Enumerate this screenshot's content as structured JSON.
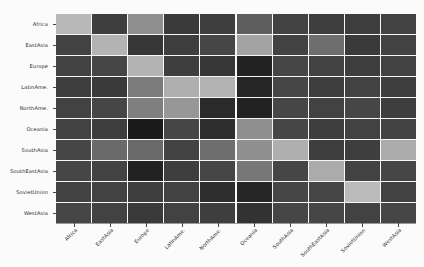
{
  "figure": {
    "background_color": "#fbfbfb",
    "plot_background_color": "#f2f2f2",
    "gridline_color": "#f7f7f7",
    "axis_color": "#9a9a9a",
    "tick_color": "#444444",
    "label_color": "#2a2a2a",
    "colormap": "grayscale",
    "xtick_rotation": "-45"
  },
  "chart_data": {
    "type": "heatmap",
    "title": "",
    "xlabel": "",
    "ylabel": "",
    "grid": true,
    "legend": "none",
    "colorbar": false,
    "vmin": 0,
    "vmax": 100,
    "categories": [
      "Africa",
      "EastAsia",
      "Europe",
      "LatinAme.",
      "NorthAme.",
      "Oceania",
      "SouthAsia",
      "SouthEastAsia",
      "SovietUnion",
      "WestAsia"
    ],
    "x": [
      "Africa",
      "EastAsia",
      "Europe",
      "LatinAme.",
      "NorthAme.",
      "Oceania",
      "SouthAsia",
      "SouthEastAsia",
      "SovietUnion",
      "WestAsia"
    ],
    "y": [
      "Africa",
      "EastAsia",
      "Europe",
      "LatinAme.",
      "NorthAme.",
      "Oceania",
      "SouthAsia",
      "SouthEastAsia",
      "SovietUnion",
      "WestAsia"
    ],
    "rows": [
      {
        "label": "Africa",
        "values": [
          82,
          22,
          62,
          20,
          22,
          38,
          24,
          22,
          22,
          24
        ]
      },
      {
        "label": "EastAsia",
        "values": [
          24,
          80,
          18,
          22,
          26,
          72,
          24,
          46,
          20,
          24
        ]
      },
      {
        "label": "Europe",
        "values": [
          24,
          26,
          80,
          22,
          18,
          8,
          26,
          24,
          22,
          24
        ]
      },
      {
        "label": "LatinAme.",
        "values": [
          22,
          20,
          52,
          78,
          80,
          10,
          26,
          22,
          24,
          22
        ]
      },
      {
        "label": "NorthAme.",
        "values": [
          24,
          26,
          54,
          66,
          12,
          8,
          26,
          24,
          26,
          22
        ]
      },
      {
        "label": "Oceania",
        "values": [
          24,
          22,
          4,
          26,
          14,
          62,
          26,
          22,
          24,
          24
        ]
      },
      {
        "label": "SouthAsia",
        "values": [
          26,
          44,
          44,
          24,
          46,
          62,
          78,
          22,
          22,
          76
        ]
      },
      {
        "label": "SouthEastAsia",
        "values": [
          26,
          24,
          8,
          22,
          26,
          50,
          26,
          76,
          24,
          26
        ]
      },
      {
        "label": "SovietUnion",
        "values": [
          24,
          24,
          22,
          24,
          14,
          10,
          26,
          26,
          84,
          24
        ]
      },
      {
        "label": "WestAsia",
        "values": [
          26,
          24,
          20,
          24,
          22,
          16,
          26,
          26,
          24,
          26
        ]
      }
    ]
  }
}
